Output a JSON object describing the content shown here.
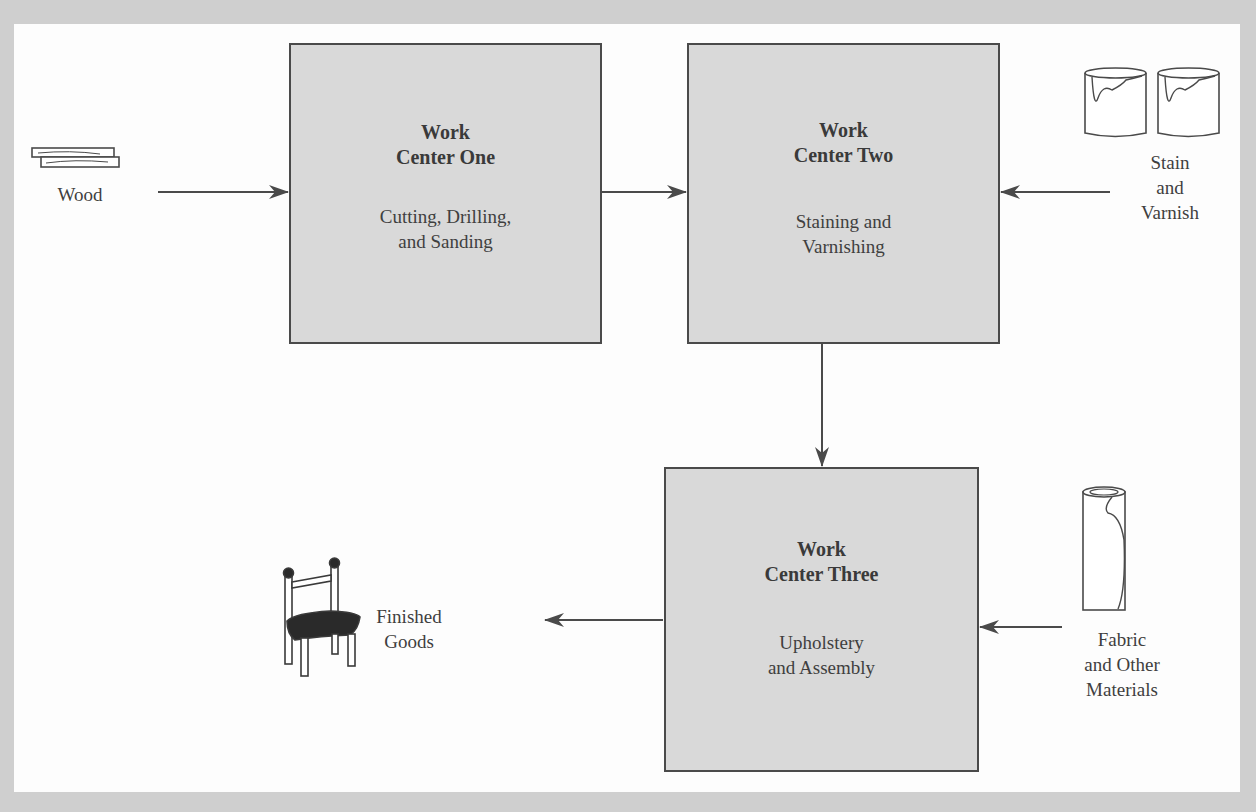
{
  "diagram": {
    "type": "process-flow",
    "colors": {
      "frame": "#cfcfcf",
      "canvas": "#fdfdfd",
      "box_fill": "#d9d9d9",
      "stroke": "#4a4a4a",
      "text": "#3a3a3a"
    },
    "work_centers": [
      {
        "id": "wc1",
        "title_line1": "Work",
        "title_line2": "Center One",
        "desc_line1": "Cutting, Drilling,",
        "desc_line2": "and Sanding"
      },
      {
        "id": "wc2",
        "title_line1": "Work",
        "title_line2": "Center Two",
        "desc_line1": "Staining and",
        "desc_line2": "Varnishing"
      },
      {
        "id": "wc3",
        "title_line1": "Work",
        "title_line2": "Center Three",
        "desc_line1": "Upholstery",
        "desc_line2": "and Assembly"
      }
    ],
    "inputs": [
      {
        "id": "wood",
        "icon": "wood-planks-icon",
        "lines": [
          "Wood"
        ]
      },
      {
        "id": "stain",
        "icon": "paint-cans-icon",
        "lines": [
          "Stain",
          "and",
          "Varnish"
        ]
      },
      {
        "id": "fabric",
        "icon": "fabric-roll-icon",
        "lines": [
          "Fabric",
          "and Other",
          "Materials"
        ]
      }
    ],
    "outputs": [
      {
        "id": "finished",
        "icon": "chair-icon",
        "lines": [
          "Finished",
          "Goods"
        ]
      }
    ],
    "flows": [
      {
        "from": "Wood",
        "to": "Work Center One"
      },
      {
        "from": "Work Center One",
        "to": "Work Center Two"
      },
      {
        "from": "Stain and Varnish",
        "to": "Work Center Two"
      },
      {
        "from": "Work Center Two",
        "to": "Work Center Three"
      },
      {
        "from": "Fabric and Other Materials",
        "to": "Work Center Three"
      },
      {
        "from": "Work Center Three",
        "to": "Finished Goods"
      }
    ]
  }
}
